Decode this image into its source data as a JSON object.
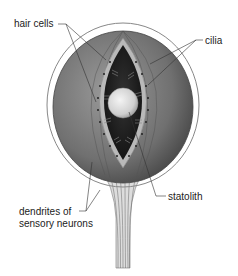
{
  "diagram": {
    "labels": {
      "hair_cells": "hair cells",
      "cilia": "cilia",
      "statolith": "statolith",
      "dendrites_line1": "dendrites of",
      "dendrites_line2": "sensory neurons"
    }
  }
}
